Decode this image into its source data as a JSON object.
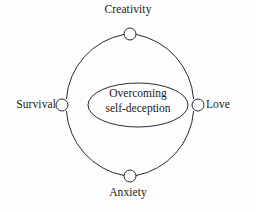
{
  "diagram": {
    "type": "cycle-diagram",
    "background_color": "#fdfdfd",
    "stroke_color": "#2b2b2b",
    "text_color": "#1a1a1a",
    "center": {
      "shape": "ellipse",
      "line1": "Overcoming",
      "line2": "self-deception"
    },
    "nodes": [
      {
        "id": "creativity",
        "label": "Creativity",
        "position": "top"
      },
      {
        "id": "love",
        "label": "Love",
        "position": "right"
      },
      {
        "id": "anxiety",
        "label": "Anxiety",
        "position": "bottom"
      },
      {
        "id": "survival",
        "label": "Survival",
        "position": "left"
      }
    ]
  }
}
